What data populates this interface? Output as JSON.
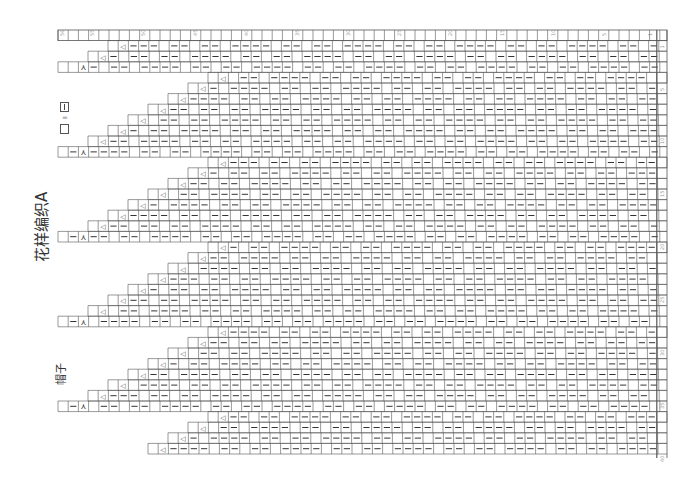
{
  "diagram": {
    "title": "花样编织A",
    "subtitle": "帽子",
    "orientation": "rotated 90° counter-clockwise",
    "legend": [
      {
        "symbol": "blank",
        "meaning": "=",
        "equals_symbol": "|"
      }
    ],
    "stitch_symbols": {
      "dash": "—",
      "triangle": "◁",
      "lambda": "⋏",
      "blank": ""
    },
    "column_numbers": [
      "56",
      "55",
      "50",
      "45",
      "40",
      "35",
      "30",
      "25",
      "20",
      "15",
      "10",
      "5",
      "1"
    ],
    "row_numbers": [
      "1",
      "5",
      "10",
      "15",
      "20",
      "25",
      "30",
      "35",
      "40"
    ],
    "grid": {
      "columns": 59,
      "rows": 41
    },
    "colors": {
      "line": "#555555",
      "text": "#333333",
      "background": "#ffffff"
    }
  }
}
